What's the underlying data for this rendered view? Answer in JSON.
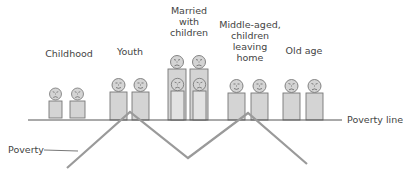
{
  "colors": {
    "figure_fill": "#d4d4d4",
    "figure_stroke": "#777777",
    "line": "#555555",
    "poverty_curve": "#9a9a9a",
    "text": "#444444"
  },
  "stages": [
    {
      "id": "childhood",
      "label": "Childhood",
      "mood": "sad"
    },
    {
      "id": "youth",
      "label": "Youth",
      "mood": "happy"
    },
    {
      "id": "married",
      "label": "Married\nwith\nchildren",
      "mood": "sad"
    },
    {
      "id": "middle-aged",
      "label": "Middle-aged,\nchildren\nleaving\nhome",
      "mood": "happy"
    },
    {
      "id": "old-age",
      "label": "Old age",
      "mood": "sad"
    }
  ],
  "poverty_line": {
    "label": "Poverty line"
  },
  "poverty_label": {
    "label": "Poverty"
  }
}
